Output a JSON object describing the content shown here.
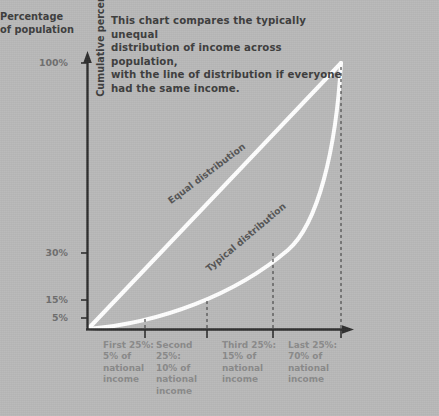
{
  "title": "This chart compares the typically unequal\ndistribution of income across population,\nwith the line of distribution if everyone\nhad the same income.",
  "axes": {
    "y_label": "Cumulative percentage of income",
    "x_label": "Percentage\nof population"
  },
  "chart_data": {
    "type": "line",
    "title": "This chart compares the typically unequal distribution of income across population, with the line of distribution if everyone had the same income.",
    "xlabel": "Percentage of population",
    "ylabel": "Cumulative percentage of income",
    "xlim": [
      0,
      100
    ],
    "ylim": [
      0,
      100
    ],
    "grid": false,
    "legend": "inline-curve-labels",
    "y_tick_labels": [
      "5%",
      "15%",
      "30%",
      "100%"
    ],
    "y_tick_values": [
      5,
      15,
      30,
      100
    ],
    "x_tick_values": [
      25,
      50,
      75,
      100
    ],
    "series": [
      {
        "name": "Equal distribution",
        "x": [
          0,
          25,
          50,
          75,
          100
        ],
        "values": [
          0,
          25,
          50,
          75,
          100
        ]
      },
      {
        "name": "Typical distribution",
        "x": [
          0,
          25,
          50,
          75,
          100
        ],
        "values": [
          0,
          5,
          15,
          30,
          100
        ]
      }
    ],
    "categories": [
      {
        "bracket": "First 25%:",
        "share": "5% of",
        "line3": "national",
        "line4": "income",
        "value": 5
      },
      {
        "bracket": "Second 25%:",
        "share": "10% of",
        "line3": "national",
        "line4": "income",
        "value": 10
      },
      {
        "bracket": "Third 25%:",
        "share": "15% of",
        "line3": "national",
        "line4": "income",
        "value": 15
      },
      {
        "bracket": "Last 25%:",
        "share": "70% of",
        "line3": "national",
        "line4": "income",
        "value": 70
      }
    ],
    "colors": {
      "background": "#b9b9b9",
      "curve": "#ffffff",
      "axis": "#2e2e2e",
      "tick_text": "#6e6e6e",
      "body_text": "#3d3d3d",
      "category_text": "#8a8a8a"
    }
  },
  "y_ticks": [
    {
      "label": "100%",
      "top": 63
    },
    {
      "label": "30%",
      "top": 253
    },
    {
      "label": "15%",
      "top": 300
    },
    {
      "label": "5%",
      "top": 318
    }
  ],
  "category_columns": [
    {
      "left": 103,
      "bracket": "First 25%:",
      "share": "5% of",
      "l3": "national",
      "l4": "income"
    },
    {
      "left": 156,
      "bracket": "Second 25%:",
      "share": "10% of",
      "l3": "national",
      "l4": "income"
    },
    {
      "left": 222,
      "bracket": "Third 25%:",
      "share": "15% of",
      "l3": "national",
      "l4": "income"
    },
    {
      "left": 288,
      "bracket": "Last 25%:",
      "share": "70% of",
      "l3": "national",
      "l4": "income"
    }
  ],
  "curve_labels": [
    {
      "text": "Equal distribution",
      "left": 169,
      "top": 196,
      "rotate": -37
    },
    {
      "text": "Typical distribution",
      "left": 207,
      "top": 264,
      "rotate": -40
    }
  ]
}
